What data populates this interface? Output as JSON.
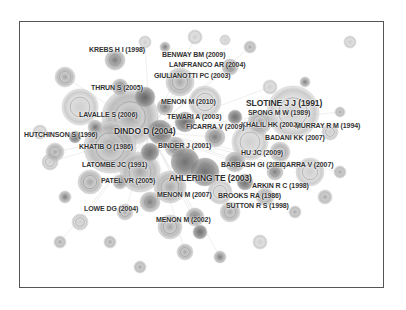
{
  "diagram": {
    "type": "co-citation network",
    "frame": {
      "border_color": "#555555"
    },
    "node_colors": [
      "#9a9a9a",
      "#b5b5b5",
      "#7a7a7a",
      "#c8c8c8",
      "#666666",
      "#d2d2d2"
    ],
    "labels": [
      {
        "text": "KREBS H I (1998)",
        "x": 88,
        "y": 49,
        "big": false
      },
      {
        "text": "BENWAY BM (2009)",
        "x": 161,
        "y": 54,
        "big": false
      },
      {
        "text": "LANFRANCO AR (2004)",
        "x": 168,
        "y": 64,
        "big": false
      },
      {
        "text": "GIULIANOTTI PC (2003)",
        "x": 153,
        "y": 75,
        "big": false
      },
      {
        "text": "THRUN S (2005)",
        "x": 90,
        "y": 87,
        "big": false
      },
      {
        "text": "MENON M (2010)",
        "x": 160,
        "y": 101,
        "big": false
      },
      {
        "text": "SLOTINE J J (1991)",
        "x": 245,
        "y": 102,
        "big": true
      },
      {
        "text": "SPONG M W (1989)",
        "x": 247,
        "y": 112,
        "big": false
      },
      {
        "text": "LAVALLE S (2006)",
        "x": 78,
        "y": 114,
        "big": false
      },
      {
        "text": "TEWARI A (2003)",
        "x": 166,
        "y": 116,
        "big": false
      },
      {
        "text": "KHALIL HK (2002)",
        "x": 240,
        "y": 124,
        "big": false
      },
      {
        "text": "MURRAY R M (1994)",
        "x": 294,
        "y": 125,
        "big": false
      },
      {
        "text": "FICARRA V (2009)",
        "x": 185,
        "y": 126,
        "big": false
      },
      {
        "text": "DINDO D (2004)",
        "x": 113,
        "y": 130,
        "big": true
      },
      {
        "text": "HUTCHINSON S (1996)",
        "x": 23,
        "y": 134,
        "big": false
      },
      {
        "text": "BADANI KK (2007)",
        "x": 264,
        "y": 137,
        "big": false
      },
      {
        "text": "KHATIB O (1986)",
        "x": 78,
        "y": 146,
        "big": false
      },
      {
        "text": "BINDER J (2001)",
        "x": 157,
        "y": 145,
        "big": false
      },
      {
        "text": "HU JC (2009)",
        "x": 240,
        "y": 152,
        "big": false
      },
      {
        "text": "LATOMBE JC (1991)",
        "x": 81,
        "y": 164,
        "big": false
      },
      {
        "text": "BARBASH GI (2010)",
        "x": 220,
        "y": 164,
        "big": false
      },
      {
        "text": "FICARRA V (2007)",
        "x": 274,
        "y": 164,
        "big": false
      },
      {
        "text": "AHLERING TE (2003)",
        "x": 168,
        "y": 177,
        "big": true
      },
      {
        "text": "PATEL VR (2005)",
        "x": 100,
        "y": 180,
        "big": false
      },
      {
        "text": "ARKIN R C (1998)",
        "x": 251,
        "y": 185,
        "big": false
      },
      {
        "text": "MENON M (2007)",
        "x": 156,
        "y": 194,
        "big": false
      },
      {
        "text": "BROOKS RA (1986)",
        "x": 217,
        "y": 195,
        "big": false
      },
      {
        "text": "LOWE DG (2004)",
        "x": 83,
        "y": 208,
        "big": false
      },
      {
        "text": "SUTTON R S (1998)",
        "x": 225,
        "y": 205,
        "big": false
      },
      {
        "text": "MENON M (2002)",
        "x": 155,
        "y": 219,
        "big": false
      }
    ]
  }
}
